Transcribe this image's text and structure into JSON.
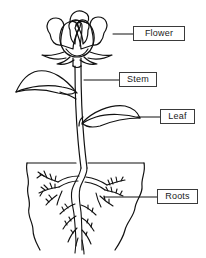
{
  "diagram": {
    "background_color": "#ffffff",
    "line_color": "#111111",
    "label_border_color": "#3a3a3a",
    "label_text_color": "#1a1a1a",
    "labels": [
      {
        "id": "flower",
        "text": "Flower",
        "leader_from_x": 113,
        "leader_to_x": 133,
        "leader_y": 34
      },
      {
        "id": "stem",
        "text": "Stem",
        "leader_from_x": 84,
        "leader_to_x": 119,
        "leader_y": 80
      },
      {
        "id": "leaf",
        "text": "Leaf",
        "leader_from_x": 137,
        "leader_to_x": 160,
        "leader_y": 117
      },
      {
        "id": "roots",
        "text": "Roots",
        "leader_from_x": 104,
        "leader_to_x": 157,
        "leader_y": 197
      }
    ],
    "parts": [
      {
        "id": "flower",
        "name": "Flower",
        "description": "Layered rose-like bloom at the top of the stem"
      },
      {
        "id": "stem",
        "name": "Stem",
        "description": "Vertical double-line stalk supporting the plant"
      },
      {
        "id": "leaf",
        "name": "Leaf",
        "description": "Pointed leaves on the left and right of the stem"
      },
      {
        "id": "roots",
        "name": "Roots",
        "description": "Branching fibrous root system below the soil line"
      }
    ],
    "soil": {
      "top_line_y": 163,
      "left_x": 27,
      "right_x": 144
    }
  }
}
